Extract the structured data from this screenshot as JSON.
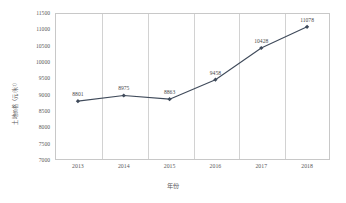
{
  "chart_data": {
    "type": "line",
    "title": "",
    "xlabel": "年份",
    "ylabel": "土地价格（元/米²）",
    "categories": [
      "2013",
      "2014",
      "2015",
      "2016",
      "2017",
      "2018"
    ],
    "values": [
      8801,
      8975,
      8863,
      9458,
      10428,
      11078
    ],
    "point_labels": [
      "8801",
      "8975",
      "8863",
      "9458",
      "10428",
      "11078"
    ],
    "series": [
      {
        "name": "土地价格",
        "values": [
          8801,
          8975,
          8863,
          9458,
          10428,
          11078
        ]
      }
    ],
    "ylim": [
      7000,
      11500
    ],
    "ytick_step": 500,
    "ytick_labels": [
      "11500",
      "11000",
      "10500",
      "10000",
      "9500",
      "9000",
      "8500",
      "8000",
      "7500",
      "7000"
    ],
    "grid": "vertical-only",
    "legend": "none",
    "marker": "diamond",
    "line_color": "#3f4a5a",
    "marker_color": "#3f4a5a",
    "plot_border_color": "#c8c8c8",
    "gridline_color": "#d2d2d2",
    "background_color": "#ffffff",
    "text_color": "#59595b"
  }
}
